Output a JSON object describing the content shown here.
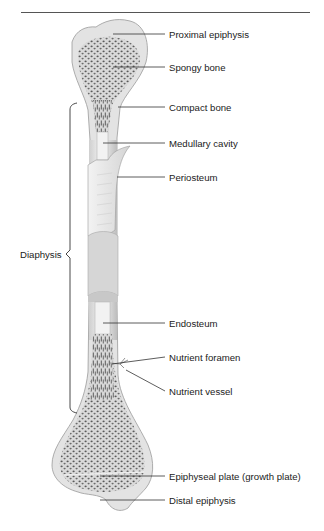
{
  "diagram": {
    "labels": [
      {
        "id": "proximal-epiphysis",
        "text": "Proximal epiphysis",
        "x": 169,
        "y": 29
      },
      {
        "id": "spongy-bone",
        "text": "Spongy bone",
        "x": 169,
        "y": 62
      },
      {
        "id": "compact-bone",
        "text": "Compact bone",
        "x": 169,
        "y": 102
      },
      {
        "id": "medullary-cavity",
        "text": "Medullary cavity",
        "x": 169,
        "y": 138
      },
      {
        "id": "periosteum",
        "text": "Periosteum",
        "x": 169,
        "y": 172
      },
      {
        "id": "endosteum",
        "text": "Endosteum",
        "x": 169,
        "y": 318
      },
      {
        "id": "nutrient-foramen",
        "text": "Nutrient foramen",
        "x": 169,
        "y": 352
      },
      {
        "id": "nutrient-vessel",
        "text": "Nutrient vessel",
        "x": 169,
        "y": 386
      },
      {
        "id": "epiphyseal-plate",
        "text": "Epiphyseal plate (growth plate)",
        "x": 169,
        "y": 471
      },
      {
        "id": "distal-epiphysis",
        "text": "Distal epiphysis",
        "x": 169,
        "y": 495
      }
    ],
    "bracket_label": {
      "id": "diaphysis",
      "text": "Diaphysis",
      "x": 20,
      "y": 254
    }
  }
}
